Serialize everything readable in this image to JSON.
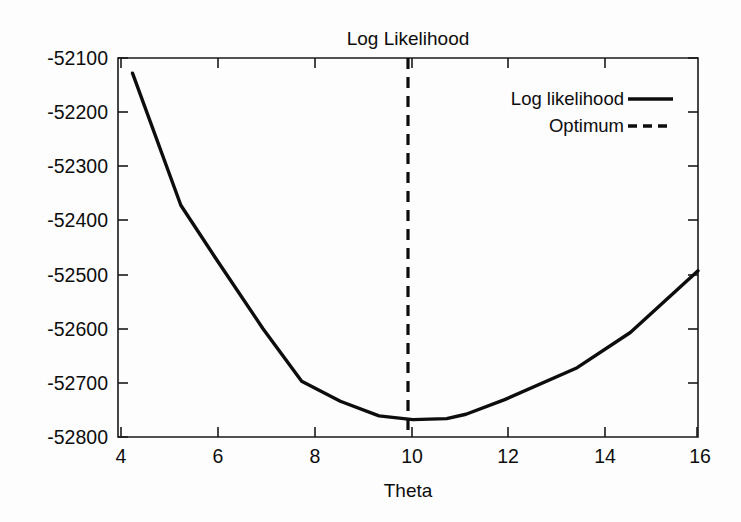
{
  "figure": {
    "title": "Log Likelihood",
    "background_color": "#fdfdfd",
    "line_color": "#0d0d0d",
    "axis_color": "#1a1a1a"
  },
  "axes": {
    "x_title": "Theta",
    "y_title": "",
    "x_ticks": [
      "4",
      "6",
      "8",
      "10",
      "12",
      "14",
      "16"
    ],
    "y_ticks": [
      "-52100",
      "-52200",
      "-52300",
      "-52400",
      "-52500",
      "-52600",
      "-52700",
      "-52800"
    ]
  },
  "legend": {
    "position": "top-right-inside",
    "entries": [
      {
        "label": "Log likelihood",
        "style": "solid"
      },
      {
        "label": "Optimum",
        "style": "dashed"
      }
    ]
  },
  "chart_data": {
    "type": "line",
    "title": "Log Likelihood",
    "xlabel": "Theta",
    "ylabel": "",
    "xlim": [
      4,
      16
    ],
    "ylim": [
      -52800,
      -52100
    ],
    "grid": false,
    "legend_position": "upper right",
    "x_ticks": [
      4,
      6,
      8,
      10,
      12,
      14,
      16
    ],
    "y_ticks": [
      -52100,
      -52200,
      -52300,
      -52400,
      -52500,
      -52600,
      -52700,
      -52800
    ],
    "series": [
      {
        "name": "Log likelihood",
        "style": "solid",
        "x": [
          4.3,
          5.3,
          6.0,
          7.0,
          7.8,
          8.6,
          9.4,
          10.1,
          10.8,
          11.2,
          12.0,
          13.5,
          14.6,
          16.0
        ],
        "y": [
          -52128,
          -52372,
          -52467,
          -52600,
          -52697,
          -52734,
          -52761,
          -52768,
          -52766,
          -52758,
          -52731,
          -52672,
          -52607,
          -52493
        ]
      },
      {
        "name": "Optimum",
        "style": "dashed",
        "type": "vline",
        "x": [
          10.0,
          10.0
        ],
        "y": [
          -52800,
          -52100
        ]
      }
    ],
    "annotations": [
      {
        "text": "optimum at Theta = 10",
        "x": 10.0,
        "y": -52768
      }
    ]
  }
}
